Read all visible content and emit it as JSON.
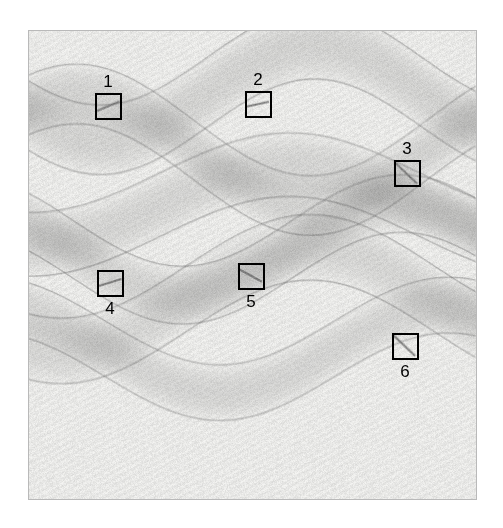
{
  "figure": {
    "type": "grayscale-texture-annotation-figure",
    "background_color": "#ffffff",
    "frame": {
      "border_color": "#b9b9b9",
      "x": 28,
      "y": 30,
      "width": 449,
      "height": 470
    },
    "plate": {
      "description": "Textured paper-like grayscale field with overlapping sinusoidal bands forming a moire interference pattern",
      "base_color": "#efefec",
      "band_color": "#6f6f6f",
      "line_color": "#3c3c3c"
    }
  },
  "annotations": {
    "box_stroke_color": "#000000",
    "box_stroke_width": 2,
    "label_color": "#000000",
    "items": [
      {
        "label": "1",
        "x": 95,
        "y": 93,
        "w": 27,
        "h": 27,
        "label_x": 95,
        "label_y": 73,
        "label_position": "above",
        "slope": -0.42
      },
      {
        "label": "2",
        "x": 245,
        "y": 91,
        "w": 27,
        "h": 27,
        "label_x": 245,
        "label_y": 71,
        "label_position": "above",
        "slope": -0.22
      },
      {
        "label": "3",
        "x": 394,
        "y": 160,
        "w": 27,
        "h": 27,
        "label_x": 394,
        "label_y": 140,
        "label_position": "above",
        "slope": 0.95
      },
      {
        "label": "4",
        "x": 97,
        "y": 270,
        "w": 27,
        "h": 27,
        "label_x": 97,
        "label_y": 300,
        "label_position": "below",
        "slope": -0.3
      },
      {
        "label": "5",
        "x": 238,
        "y": 263,
        "w": 27,
        "h": 27,
        "label_x": 238,
        "label_y": 293,
        "label_position": "below",
        "slope": 0.55
      },
      {
        "label": "6",
        "x": 392,
        "y": 333,
        "w": 27,
        "h": 27,
        "label_x": 392,
        "label_y": 363,
        "label_position": "below",
        "slope": 0.95
      }
    ]
  },
  "chart_data": {
    "type": "heatmap",
    "title": "",
    "xlabel": "",
    "ylabel": "",
    "grid": false,
    "legend_position": "none",
    "tick_labels": [],
    "bands": [
      {
        "name": "band-1",
        "amplitude": 48,
        "wavelength": 430,
        "phase": 0.1,
        "y_center": 92,
        "thickness": 70,
        "darkness": 0.3
      },
      {
        "name": "band-2",
        "amplitude": -56,
        "wavelength": 470,
        "phase": 0.55,
        "y_center": 150,
        "thickness": 60,
        "darkness": 0.3
      },
      {
        "name": "band-3",
        "amplitude": 40,
        "wavelength": 520,
        "phase": 1.2,
        "y_center": 205,
        "thickness": 64,
        "darkness": 0.28
      },
      {
        "name": "band-4",
        "amplitude": -46,
        "wavelength": 440,
        "phase": 2.1,
        "y_center": 250,
        "thickness": 58,
        "darkness": 0.3
      },
      {
        "name": "band-5",
        "amplitude": 52,
        "wavelength": 500,
        "phase": 0.8,
        "y_center": 300,
        "thickness": 66,
        "darkness": 0.26
      },
      {
        "name": "band-6",
        "amplitude": -44,
        "wavelength": 460,
        "phase": 1.7,
        "y_center": 350,
        "thickness": 56,
        "darkness": 0.28
      }
    ]
  }
}
